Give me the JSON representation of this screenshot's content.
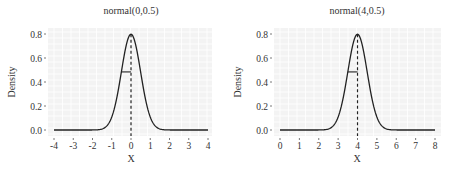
{
  "chart_data": [
    {
      "type": "line",
      "title": "normal(0,0.5)",
      "xlabel": "X",
      "ylabel": "Density",
      "distribution": {
        "name": "normal",
        "mean": 0,
        "sd": 0.5
      },
      "xlim": [
        -4,
        4
      ],
      "ylim": [
        0,
        0.8
      ],
      "x_ticks": [
        -4,
        -3,
        -2,
        -1,
        0,
        1,
        2,
        3,
        4
      ],
      "x_tick_labels": [
        "-4",
        "-3",
        "-2",
        "-1",
        "0",
        "1",
        "2",
        "3",
        "4"
      ],
      "y_ticks": [
        0.0,
        0.2,
        0.4,
        0.6,
        0.8
      ],
      "y_tick_labels": [
        "0.0",
        "0.2",
        "0.4",
        "0.6",
        "0.8"
      ],
      "peak_density": 0.798,
      "annotations": [
        {
          "type": "vline",
          "x": 0,
          "style": "dashed",
          "label": "mean"
        },
        {
          "type": "hsegment",
          "x0": -0.5,
          "x1": 0,
          "y": 0.484,
          "label": "sd"
        }
      ],
      "grid": true,
      "legend": "none"
    },
    {
      "type": "line",
      "title": "normal(4,0.5)",
      "xlabel": "X",
      "ylabel": "Density",
      "distribution": {
        "name": "normal",
        "mean": 4,
        "sd": 0.5
      },
      "xlim": [
        0,
        8
      ],
      "ylim": [
        0,
        0.8
      ],
      "x_ticks": [
        0,
        1,
        2,
        3,
        4,
        5,
        6,
        7,
        8
      ],
      "x_tick_labels": [
        "0",
        "1",
        "2",
        "3",
        "4",
        "5",
        "6",
        "7",
        "8"
      ],
      "y_ticks": [
        0.0,
        0.2,
        0.4,
        0.6,
        0.8
      ],
      "y_tick_labels": [
        "0.0",
        "0.2",
        "0.4",
        "0.6",
        "0.8"
      ],
      "peak_density": 0.798,
      "annotations": [
        {
          "type": "vline",
          "x": 4,
          "style": "dashed",
          "label": "mean"
        },
        {
          "type": "hsegment",
          "x0": 3.5,
          "x1": 4,
          "y": 0.484,
          "label": "sd"
        }
      ],
      "grid": true,
      "legend": "none"
    }
  ],
  "colors": {
    "panel_bg": "#f3f3f3",
    "grid": "#ffffff",
    "curve": "#222222",
    "text": "#333333"
  }
}
